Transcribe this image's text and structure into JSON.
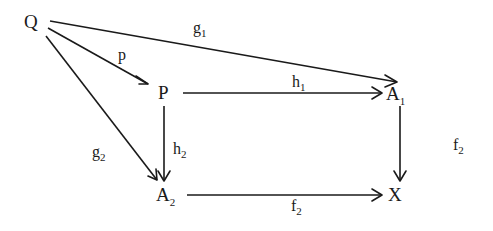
{
  "diagram": {
    "type": "commutative-diagram",
    "nodes": {
      "Q": {
        "label": "Q",
        "sub": ""
      },
      "P": {
        "label": "P",
        "sub": ""
      },
      "A1": {
        "label": "A",
        "sub": "1"
      },
      "A2": {
        "label": "A",
        "sub": "2"
      },
      "X": {
        "label": "X",
        "sub": ""
      }
    },
    "edges": {
      "Q_P": {
        "from": "Q",
        "to": "P",
        "label": "p",
        "sub": ""
      },
      "Q_A1": {
        "from": "Q",
        "to": "A1",
        "label": "g",
        "sub": "1"
      },
      "Q_A2": {
        "from": "Q",
        "to": "A2",
        "label": "g",
        "sub": "2"
      },
      "P_A1": {
        "from": "P",
        "to": "A1",
        "label": "h",
        "sub": "1"
      },
      "P_A2": {
        "from": "P",
        "to": "A2",
        "label": "h",
        "sub": "2"
      },
      "A1_X": {
        "from": "A1",
        "to": "X",
        "label": "f",
        "sub": "2"
      },
      "A2_X": {
        "from": "A2",
        "to": "X",
        "label": "f",
        "sub": "2"
      }
    }
  }
}
